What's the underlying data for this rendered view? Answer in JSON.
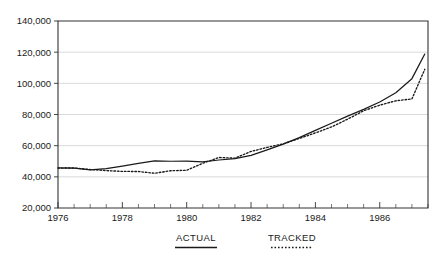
{
  "chart_data": {
    "type": "line",
    "title": "",
    "subtitle": "",
    "xlabel": "",
    "ylabel": "",
    "grid": "horizontal",
    "legend_position": "bottom",
    "xlim": [
      1976,
      1987.5
    ],
    "ylim": [
      20000,
      140000
    ],
    "y_ticks": [
      20000,
      40000,
      60000,
      80000,
      100000,
      120000,
      140000
    ],
    "y_tick_labels": [
      "20,000",
      "40,000",
      "60,000",
      "80,000",
      "100,000",
      "120,000",
      "140,000"
    ],
    "x_ticks": [
      1976,
      1978,
      1980,
      1982,
      1984,
      1986
    ],
    "x_tick_labels": [
      "1976",
      "1978",
      "1980",
      "1982",
      "1984",
      "1986"
    ],
    "x_minor_tick_interval": 0.5,
    "x": [
      1976,
      1976.5,
      1977,
      1977.5,
      1978,
      1978.5,
      1979,
      1979.5,
      1980,
      1980.5,
      1981,
      1981.5,
      1982,
      1982.5,
      1983,
      1983.5,
      1984,
      1984.5,
      1985,
      1985.5,
      1986,
      1986.5,
      1987,
      1987.4
    ],
    "series": [
      {
        "name": "ACTUAL",
        "style": "solid",
        "color": "#1a1a1a",
        "values": [
          45800,
          45600,
          44500,
          45200,
          46800,
          48600,
          50300,
          50000,
          50100,
          49600,
          50800,
          51700,
          53800,
          57300,
          61000,
          65200,
          69800,
          74400,
          79000,
          83300,
          88000,
          94000,
          103000,
          118800
        ]
      },
      {
        "name": "TRACKED",
        "style": "dotted",
        "color": "#1a1a1a",
        "values": [
          45600,
          45700,
          44700,
          44000,
          43500,
          43400,
          42300,
          43900,
          44200,
          48700,
          52400,
          52000,
          56300,
          58900,
          61200,
          64600,
          68200,
          72000,
          77000,
          82400,
          86000,
          88800,
          90000,
          109000
        ]
      }
    ],
    "legend": [
      {
        "label": "ACTUAL",
        "style": "solid"
      },
      {
        "label": "TRACKED",
        "style": "dotted"
      }
    ]
  }
}
